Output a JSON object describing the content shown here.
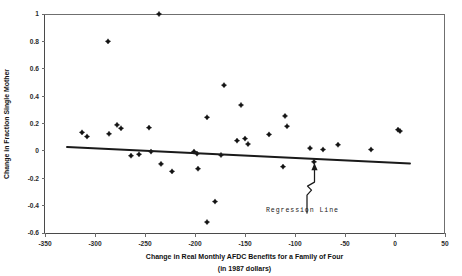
{
  "chart_data": {
    "type": "scatter",
    "title": "",
    "xlabel": "Change in Real Monthly AFDC Benefits for a Family of Four",
    "xlabel_line2": "(in 1987 dollars)",
    "ylabel": "Change in Fraction Single Mother",
    "xlim": [
      -350,
      50
    ],
    "ylim": [
      -0.6,
      1
    ],
    "grid": false,
    "legend": false,
    "xticks": [
      -350,
      -300,
      -250,
      -200,
      -150,
      -100,
      -50,
      0,
      50
    ],
    "xtick_labels": [
      "-350",
      "-300",
      "-250",
      "-200",
      "-150",
      "-100",
      "-50",
      "0",
      "50"
    ],
    "yticks": [
      1,
      0.8,
      0.6,
      0.4,
      0.2,
      0,
      -0.2,
      -0.4,
      -0.6
    ],
    "ytick_labels": [
      "1",
      "0.8",
      "0.6",
      "0.4",
      "0.2",
      "0",
      "-0.2",
      "-0.4",
      "-0.6"
    ],
    "marker_color": "#151515",
    "line_color": "#1a1a1a",
    "points": [
      {
        "x": -313,
        "y": 0.135
      },
      {
        "x": -308,
        "y": 0.105
      },
      {
        "x": -287,
        "y": 0.8
      },
      {
        "x": -286,
        "y": 0.125
      },
      {
        "x": -278,
        "y": 0.19
      },
      {
        "x": -274,
        "y": 0.165
      },
      {
        "x": -264,
        "y": -0.035
      },
      {
        "x": -256,
        "y": -0.025
      },
      {
        "x": -246,
        "y": 0.17
      },
      {
        "x": -244,
        "y": -0.005
      },
      {
        "x": -236,
        "y": 1.0
      },
      {
        "x": -234,
        "y": -0.095
      },
      {
        "x": -223,
        "y": -0.15
      },
      {
        "x": -201,
        "y": -0.005
      },
      {
        "x": -198,
        "y": -0.02
      },
      {
        "x": -197,
        "y": -0.13
      },
      {
        "x": -188,
        "y": 0.245
      },
      {
        "x": -188,
        "y": -0.52
      },
      {
        "x": -180,
        "y": -0.37
      },
      {
        "x": -174,
        "y": -0.03
      },
      {
        "x": -171,
        "y": 0.48
      },
      {
        "x": -158,
        "y": 0.075
      },
      {
        "x": -154,
        "y": 0.335
      },
      {
        "x": -150,
        "y": 0.09
      },
      {
        "x": -147,
        "y": 0.05
      },
      {
        "x": -126,
        "y": 0.12
      },
      {
        "x": -112,
        "y": -0.115
      },
      {
        "x": -110,
        "y": 0.255
      },
      {
        "x": -108,
        "y": 0.18
      },
      {
        "x": -85,
        "y": 0.02
      },
      {
        "x": -81,
        "y": -0.08
      },
      {
        "x": -72,
        "y": 0.01
      },
      {
        "x": -57,
        "y": 0.045
      },
      {
        "x": -24,
        "y": 0.01
      },
      {
        "x": 3,
        "y": 0.155
      },
      {
        "x": 5,
        "y": 0.145
      }
    ],
    "regression_line": {
      "label": "Regression Line",
      "x_start": -328,
      "y_start": 0.028,
      "x_end": 15,
      "y_end": -0.092
    },
    "annotation": {
      "text": "Regression Line",
      "target_x": -81,
      "target_y": -0.082
    }
  }
}
